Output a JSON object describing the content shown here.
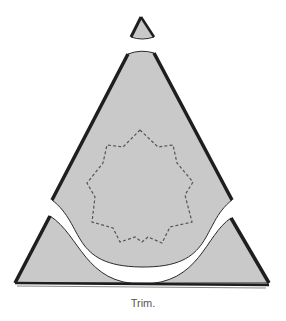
{
  "figure": {
    "caption": "Trim.",
    "colors": {
      "paper_fill": "#c9c9c9",
      "edge": "#2a2a2a",
      "thick_edge": "#1e1e1e",
      "dashed_outline": "#555555",
      "background": "#ffffff",
      "caption": "#555555"
    },
    "pieces": [
      {
        "name": "tip",
        "label": ""
      },
      {
        "name": "upper-piece",
        "label": ""
      },
      {
        "name": "lower-piece",
        "label": ""
      }
    ],
    "star_outline": {
      "style": "dashed",
      "points": "140,130 158,147 173,145 177,163 193,182 185,195 192,222 170,227 162,243 148,237 142,242 135,237 120,242 113,228 92,222 95,197 87,183 103,163 107,145 123,147"
    }
  }
}
